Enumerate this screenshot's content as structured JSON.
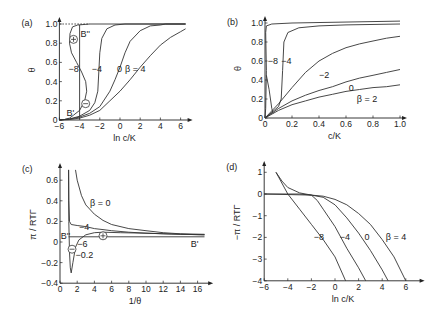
{
  "chart_data": [
    {
      "panel": "(a)",
      "type": "line",
      "xlabel": "ln c/K",
      "ylabel": "θ",
      "xlim": [
        -6,
        6.5
      ],
      "ylim": [
        0,
        1.0
      ],
      "xticks": [
        -6,
        -4,
        -2,
        0,
        2,
        4,
        6
      ],
      "yticks": [
        0.0,
        0.2,
        0.4,
        0.6,
        0.8,
        1.0
      ],
      "px": {
        "x0": 120,
        "xs": 10.1,
        "y0": 120,
        "ys": 96
      },
      "annotations": [
        {
          "text": "B''",
          "x": -3.9,
          "y": 0.9
        },
        {
          "text": "B'",
          "x": -5.3,
          "y": 0.07
        },
        {
          "text": "⊕",
          "x": -4.6,
          "y": 0.84,
          "circle": true
        },
        {
          "text": "⊖",
          "x": -3.4,
          "y": 0.17,
          "circle": true
        },
        {
          "text": "−8",
          "x": -5.1,
          "y": 0.53
        },
        {
          "text": "−4",
          "x": -2.8,
          "y": 0.53
        },
        {
          "text": "0",
          "x": -0.3,
          "y": 0.53
        },
        {
          "text": "β = 4",
          "x": 0.5,
          "y": 0.53,
          "italic_beta": true
        }
      ],
      "series": [
        {
          "name": "β = −8",
          "points": [
            [
              -6,
              0
            ],
            [
              -5.5,
              0.005
            ],
            [
              -5,
              0.02
            ],
            [
              -4.6,
              0.05
            ],
            [
              -4,
              0.1
            ],
            [
              -3.5,
              0.2
            ],
            [
              -3.3,
              0.3
            ],
            [
              -3.4,
              0.4
            ],
            [
              -3.8,
              0.5
            ],
            [
              -4.3,
              0.6
            ],
            [
              -4.8,
              0.7
            ],
            [
              -5.0,
              0.8
            ],
            [
              -4.95,
              0.9
            ],
            [
              -4.7,
              0.97
            ],
            [
              -4.2,
              0.99
            ],
            [
              -3,
              1.0
            ],
            [
              6.5,
              1.0
            ]
          ]
        },
        {
          "name": "β = −4",
          "points": [
            [
              -6,
              0
            ],
            [
              -5,
              0.01
            ],
            [
              -4,
              0.04
            ],
            [
              -3,
              0.1
            ],
            [
              -2.5,
              0.18
            ],
            [
              -2.2,
              0.3
            ],
            [
              -2.1,
              0.5
            ],
            [
              -2.0,
              0.7
            ],
            [
              -1.8,
              0.85
            ],
            [
              -1.3,
              0.95
            ],
            [
              -0.5,
              0.99
            ],
            [
              0.5,
              1.0
            ],
            [
              6.5,
              1.0
            ]
          ]
        },
        {
          "name": "β = 0",
          "points": [
            [
              -6,
              0
            ],
            [
              -5,
              0.01
            ],
            [
              -4,
              0.03
            ],
            [
              -3,
              0.07
            ],
            [
              -2,
              0.14
            ],
            [
              -1,
              0.3
            ],
            [
              -0.5,
              0.42
            ],
            [
              0,
              0.55
            ],
            [
              0.5,
              0.7
            ],
            [
              1,
              0.82
            ],
            [
              2,
              0.93
            ],
            [
              3,
              0.98
            ],
            [
              4,
              0.99
            ],
            [
              4.5,
              1.0
            ],
            [
              6.5,
              1.0
            ]
          ]
        },
        {
          "name": "β = 4",
          "points": [
            [
              -6,
              0
            ],
            [
              -5,
              0.005
            ],
            [
              -4,
              0.02
            ],
            [
              -3,
              0.05
            ],
            [
              -2,
              0.1
            ],
            [
              -1,
              0.2
            ],
            [
              0,
              0.3
            ],
            [
              1,
              0.42
            ],
            [
              2,
              0.55
            ],
            [
              3,
              0.67
            ],
            [
              4,
              0.78
            ],
            [
              5,
              0.86
            ],
            [
              6,
              0.92
            ],
            [
              6.5,
              0.95
            ]
          ]
        },
        {
          "name": "B'–B'' line",
          "points": [
            [
              -4,
              0.01
            ],
            [
              -4,
              0.99
            ]
          ]
        },
        {
          "name": "θ = 1 dotted",
          "dotted": true,
          "points": [
            [
              -6,
              1.0
            ],
            [
              -3,
              1.0
            ]
          ]
        }
      ]
    },
    {
      "panel": "(b)",
      "type": "line",
      "xlabel": "c/K",
      "ylabel": "θ",
      "xlim": [
        0,
        1.0
      ],
      "ylim": [
        0,
        1.0
      ],
      "xticks": [
        0.0,
        0.2,
        0.4,
        0.6,
        0.8,
        1.0
      ],
      "yticks": [
        0.0,
        0.2,
        0.4,
        0.6,
        0.8,
        1.0
      ],
      "px": {
        "x0": 265,
        "xs": 135,
        "y0": 118,
        "ys": 95
      },
      "annotations": [
        {
          "text": "−8",
          "x": 0.02,
          "y": 0.6
        },
        {
          "text": "−4",
          "x": 0.12,
          "y": 0.6
        },
        {
          "text": "−2",
          "x": 0.4,
          "y": 0.45
        },
        {
          "text": "0",
          "x": 0.62,
          "y": 0.32
        },
        {
          "text": "β = 2",
          "x": 0.68,
          "y": 0.2,
          "italic_beta": true
        }
      ],
      "series": [
        {
          "name": "β = −8",
          "points": [
            [
              0,
              0
            ],
            [
              0.005,
              0.1
            ],
            [
              0.01,
              0.5
            ],
            [
              0.005,
              0.9
            ],
            [
              0.01,
              0.97
            ],
            [
              0.05,
              0.99
            ],
            [
              0.2,
              1.0
            ],
            [
              1.0,
              1.02
            ]
          ]
        },
        {
          "name": "β = −8 spike",
          "points": [
            [
              0.01,
              0.45
            ],
            [
              0.03,
              0.3
            ],
            [
              0.05,
              0.1
            ],
            [
              0.06,
              0.05
            ]
          ]
        },
        {
          "name": "β = −4",
          "points": [
            [
              0,
              0
            ],
            [
              0.05,
              0.06
            ],
            [
              0.1,
              0.12
            ],
            [
              0.12,
              0.2
            ],
            [
              0.13,
              0.5
            ],
            [
              0.14,
              0.8
            ],
            [
              0.17,
              0.9
            ],
            [
              0.25,
              0.95
            ],
            [
              0.4,
              0.97
            ],
            [
              0.6,
              0.98
            ],
            [
              1.0,
              0.99
            ]
          ]
        },
        {
          "name": "β = −2",
          "points": [
            [
              0,
              0
            ],
            [
              0.1,
              0.15
            ],
            [
              0.2,
              0.32
            ],
            [
              0.3,
              0.48
            ],
            [
              0.4,
              0.6
            ],
            [
              0.5,
              0.68
            ],
            [
              0.6,
              0.74
            ],
            [
              0.7,
              0.78
            ],
            [
              0.8,
              0.81
            ],
            [
              0.9,
              0.84
            ],
            [
              1.0,
              0.86
            ]
          ]
        },
        {
          "name": "β = 0",
          "points": [
            [
              0,
              0
            ],
            [
              0.1,
              0.1
            ],
            [
              0.2,
              0.18
            ],
            [
              0.3,
              0.24
            ],
            [
              0.4,
              0.29
            ],
            [
              0.5,
              0.33
            ],
            [
              0.6,
              0.38
            ],
            [
              0.7,
              0.42
            ],
            [
              0.8,
              0.45
            ],
            [
              0.9,
              0.48
            ],
            [
              1.0,
              0.51
            ]
          ]
        },
        {
          "name": "β = 2",
          "points": [
            [
              0,
              0
            ],
            [
              0.1,
              0.08
            ],
            [
              0.2,
              0.14
            ],
            [
              0.3,
              0.18
            ],
            [
              0.4,
              0.22
            ],
            [
              0.5,
              0.25
            ],
            [
              0.6,
              0.28
            ],
            [
              0.7,
              0.3
            ],
            [
              0.8,
              0.32
            ],
            [
              0.9,
              0.33
            ],
            [
              1.0,
              0.35
            ]
          ]
        }
      ]
    },
    {
      "panel": "(c)",
      "type": "line",
      "xlabel": "1/θ",
      "ylabel": "π / RTΓ",
      "xlim": [
        0,
        17
      ],
      "ylim": [
        -0.4,
        0.7
      ],
      "xticks": [
        0,
        2,
        4,
        6,
        8,
        10,
        12,
        14,
        16
      ],
      "yticks": [
        -0.4,
        -0.2,
        0.0,
        0.2,
        0.4,
        0.6
      ],
      "px": {
        "x0": 60,
        "xs": 8.6,
        "y0": 242,
        "ys": 103
      },
      "annotations": [
        {
          "text": "β = 0",
          "x": 3.5,
          "y": 0.38,
          "italic_beta": true
        },
        {
          "text": "−4",
          "x": 2.2,
          "y": 0.15
        },
        {
          "text": "B''",
          "x": 0.1,
          "y": 0.06
        },
        {
          "text": "B'",
          "x": 15.2,
          "y": -0.02
        },
        {
          "text": "−6",
          "x": 2.0,
          "y": -0.02
        },
        {
          "text": "−0.2",
          "x": 1.8,
          "y": -0.13
        },
        {
          "text": "⊕",
          "x": 5.0,
          "y": 0.06,
          "circle": true
        },
        {
          "text": "⊖",
          "x": 1.4,
          "y": -0.07,
          "circle": true
        }
      ],
      "series": [
        {
          "name": "β = 0",
          "points": [
            [
              1.8,
              0.7
            ],
            [
              2,
              0.6
            ],
            [
              2.5,
              0.45
            ],
            [
              3,
              0.36
            ],
            [
              4,
              0.27
            ],
            [
              5,
              0.21
            ],
            [
              6,
              0.17
            ],
            [
              8,
              0.13
            ],
            [
              10,
              0.11
            ],
            [
              12,
              0.09
            ],
            [
              14,
              0.08
            ],
            [
              16.8,
              0.075
            ]
          ]
        },
        {
          "name": "β = −4",
          "points": [
            [
              1.0,
              0.7
            ],
            [
              1.02,
              0.4
            ],
            [
              1.1,
              0.2
            ],
            [
              1.3,
              0.17
            ],
            [
              2,
              0.16
            ],
            [
              3,
              0.15
            ],
            [
              4,
              0.13
            ],
            [
              5,
              0.12
            ],
            [
              6,
              0.11
            ],
            [
              8,
              0.095
            ],
            [
              10,
              0.085
            ],
            [
              12,
              0.08
            ],
            [
              14,
              0.075
            ],
            [
              16.8,
              0.07
            ]
          ]
        },
        {
          "name": "β = −6",
          "points": [
            [
              1.0,
              0.7
            ],
            [
              1.02,
              0.2
            ],
            [
              1.1,
              -0.1
            ],
            [
              1.2,
              -0.25
            ],
            [
              1.3,
              -0.3
            ],
            [
              1.5,
              -0.2
            ],
            [
              1.8,
              -0.05
            ],
            [
              2.2,
              0.02
            ],
            [
              3,
              0.07
            ],
            [
              4,
              0.09
            ],
            [
              5,
              0.095
            ],
            [
              7,
              0.09
            ],
            [
              10,
              0.085
            ],
            [
              13,
              0.078
            ],
            [
              16.8,
              0.07
            ]
          ]
        },
        {
          "name": "B'–B'' line",
          "points": [
            [
              1.0,
              0.05
            ],
            [
              16.8,
              0.05
            ]
          ]
        }
      ]
    },
    {
      "panel": "(d)",
      "type": "line",
      "xlabel": "ln c/K",
      "ylabel": "−π / RTΓ",
      "xlim": [
        -6,
        7
      ],
      "ylim": [
        -4,
        1.2
      ],
      "xticks": [
        -6,
        -4,
        -2,
        0,
        2,
        4,
        6
      ],
      "yticks": [
        -4,
        -3,
        -2,
        -1,
        0,
        1
      ],
      "px": {
        "x0": 335,
        "xs": 11.8,
        "y0": 194,
        "ys": 21.7
      },
      "annotations": [
        {
          "text": "−8",
          "x": -1.8,
          "y": -2
        },
        {
          "text": "−4",
          "x": 0.4,
          "y": -2
        },
        {
          "text": "0",
          "x": 2.5,
          "y": -2
        },
        {
          "text": "β = 4",
          "x": 4.3,
          "y": -2,
          "italic_beta": true
        }
      ],
      "series": [
        {
          "name": "β = −8",
          "points": [
            [
              -5,
              1.0
            ],
            [
              -4,
              0.0
            ],
            [
              -3,
              -0.7
            ],
            [
              -2,
              -1.4
            ],
            [
              -1,
              -2.1
            ],
            [
              0,
              -2.9
            ],
            [
              0.9,
              -4
            ]
          ]
        },
        {
          "name": "β = −4",
          "points": [
            [
              -6,
              0
            ],
            [
              -3,
              0
            ],
            [
              -2,
              -0.05
            ],
            [
              -1.5,
              -0.3
            ],
            [
              -1,
              -0.7
            ],
            [
              0,
              -1.5
            ],
            [
              1,
              -2.5
            ],
            [
              2,
              -3.4
            ],
            [
              2.6,
              -4
            ]
          ]
        },
        {
          "name": "β = 0",
          "points": [
            [
              -6,
              0
            ],
            [
              -2,
              -0.05
            ],
            [
              -1,
              -0.15
            ],
            [
              0,
              -0.5
            ],
            [
              1,
              -1.1
            ],
            [
              2,
              -1.8
            ],
            [
              3,
              -2.6
            ],
            [
              4,
              -3.5
            ],
            [
              4.5,
              -4
            ]
          ]
        },
        {
          "name": "β = 4",
          "points": [
            [
              -5,
              1.0
            ],
            [
              -4.5,
              0.6
            ],
            [
              -4,
              0.3
            ],
            [
              -3,
              0.05
            ],
            [
              -2,
              -0.05
            ],
            [
              -1,
              -0.1
            ],
            [
              0,
              -0.25
            ],
            [
              1,
              -0.5
            ],
            [
              2,
              -0.9
            ],
            [
              3,
              -1.4
            ],
            [
              4,
              -2.1
            ],
            [
              5,
              -2.9
            ],
            [
              6,
              -4
            ]
          ]
        }
      ]
    }
  ]
}
